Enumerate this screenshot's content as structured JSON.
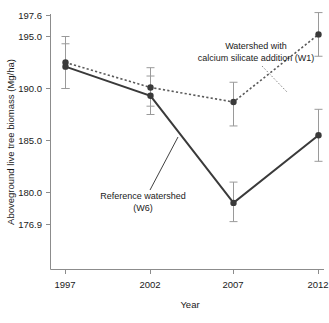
{
  "chart_data": {
    "type": "line",
    "title": "",
    "xlabel": "Year",
    "ylabel": "Aboveground live tree biomass (Mg/ha)",
    "categories": [
      "1997",
      "2002",
      "2007",
      "2012"
    ],
    "x": [
      1997,
      2002,
      2007,
      2012
    ],
    "xlim": [
      1996,
      2013
    ],
    "ylim": [
      176.9,
      197.6
    ],
    "yticks": [
      "197.6",
      "195.0",
      "190.0",
      "185.0",
      "180.0",
      "176.9"
    ],
    "ytick_values": [
      197.6,
      195.0,
      190.0,
      185.0,
      180.0,
      176.9
    ],
    "xticks": [
      "1997",
      "2002",
      "2007",
      "2012"
    ],
    "grid": false,
    "legend_position": "inline-annotations",
    "series": [
      {
        "name": "Watershed with calcium silicate addition (W1)",
        "style": "dotted",
        "values": [
          192.5,
          190.1,
          188.7,
          195.2
        ],
        "error_low": [
          190.0,
          188.3,
          186.4,
          193.1
        ],
        "error_high": [
          195.0,
          192.0,
          190.6,
          197.3
        ]
      },
      {
        "name": "Reference watershed (W6)",
        "style": "solid",
        "values": [
          192.1,
          189.3,
          179.0,
          185.5
        ],
        "error_low": [
          190.0,
          187.5,
          177.2,
          183.0
        ],
        "error_high": [
          194.3,
          191.2,
          181.0,
          188.0
        ]
      }
    ],
    "annotations": [
      {
        "id": "annotation-w1",
        "line1": "Watershed with",
        "line2": "calcium silicate addition (W1)"
      },
      {
        "id": "annotation-w6",
        "line1": "Reference watershed",
        "line2": "(W6)"
      }
    ],
    "colors": {
      "solid_series": "#3a3a3a",
      "dotted_series": "#5a5a5a",
      "error_bar": "#9a9a9a",
      "axis": "#8c8c8c",
      "text": "#1a1a1a",
      "background": "#ffffff"
    }
  }
}
